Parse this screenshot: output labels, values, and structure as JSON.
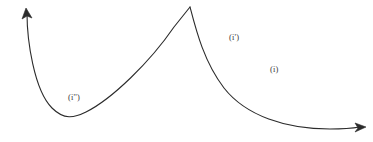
{
  "figure": {
    "background_color": "#ffffff",
    "stroke_color": "#2b2b2b",
    "stroke_width": 1.1,
    "width": 373,
    "height": 142,
    "labels": {
      "region_i": "(i)",
      "region_i_prime": "(i')",
      "region_i_double_prime": "(i'')"
    },
    "label_color": "#3a3a3a",
    "curve": {
      "type": "cusp-curve",
      "description": "Single continuous curve with a sharp cusp at the top center; left branch falls from an upward arrowhead at the top-left to a minimum then rises to the cusp; right branch falls steeply from the cusp and flattens to a near-horizontal asymptote ending in a rightward arrowhead.",
      "cusp_point": [
        190,
        7
      ],
      "left_arrow_tip": [
        26,
        9
      ],
      "right_arrow_tip": [
        365,
        127
      ],
      "left_branch_minimum": [
        80,
        117
      ],
      "right_branch_asymptote_y": 129,
      "left_branch_path": "M 27 13 C 27 40, 34 90, 52 108 C 64 120, 74 118, 86 112 C 112 99, 150 62, 174 27 L 190 7",
      "right_branch_path": "M 190 7 C 196 30, 204 62, 224 88 C 246 116, 286 129, 330 129 C 344 129, 354 128, 360 127"
    }
  }
}
